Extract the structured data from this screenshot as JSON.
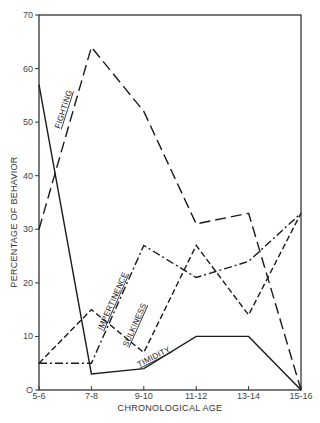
{
  "chart_data": {
    "type": "line",
    "title": "",
    "xlabel": "CHRONOLOGICAL AGE",
    "ylabel": "PERCENTAGE OF BEHAVIOR",
    "categories": [
      "5-6",
      "7-8",
      "9-10",
      "11-12",
      "13-14",
      "15-16"
    ],
    "yticks": [
      0,
      10,
      20,
      30,
      40,
      50,
      60,
      70
    ],
    "ylim": [
      0,
      70
    ],
    "grid": false,
    "legend": "inline labels on lines",
    "series": [
      {
        "name": "FIGHTING",
        "style": "long-dash",
        "values": [
          30,
          64,
          52,
          31,
          33,
          0
        ]
      },
      {
        "name": "TIMIDITY",
        "style": "solid",
        "values": [
          57,
          3,
          4,
          10,
          10,
          0
        ]
      },
      {
        "name": "IMPERTINENCE",
        "style": "dash-dot",
        "values": [
          5,
          5,
          27,
          21,
          24,
          33
        ]
      },
      {
        "name": "SULKINESS",
        "style": "short-dash",
        "values": [
          5,
          15,
          7,
          27,
          14,
          33
        ]
      }
    ],
    "colors": {
      "line": "#1a1a1a",
      "axis": "#333333",
      "text": "#444444"
    }
  }
}
